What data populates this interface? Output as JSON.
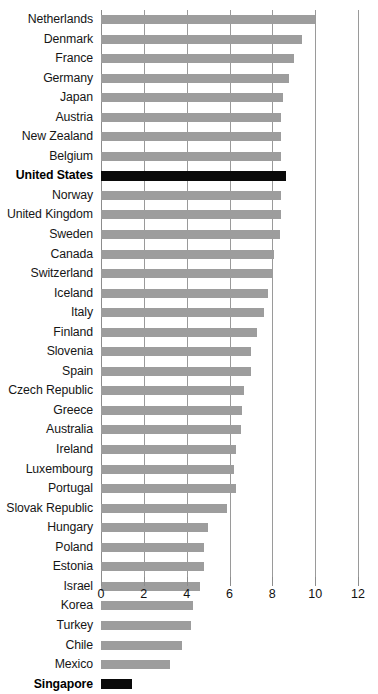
{
  "chart_data": {
    "type": "bar",
    "orientation": "horizontal",
    "title": "",
    "xlabel": "",
    "ylabel": "",
    "xlim": [
      0,
      12
    ],
    "xticks": [
      0,
      2,
      4,
      6,
      8,
      10,
      12
    ],
    "xtick_labels": [
      "0",
      "2",
      "4",
      "6",
      "8",
      "10",
      "12"
    ],
    "grid": true,
    "legend": false,
    "sorted": "descending",
    "colors": {
      "bar": "#9d9d9d",
      "bar_highlight": "#0a0a0a",
      "gridline": "#9a9a9a",
      "text": "#111111",
      "background": "#ffffff"
    },
    "highlighted_categories": [
      "United States",
      "Singapore"
    ],
    "categories": [
      "Netherlands",
      "Denmark",
      "France",
      "Germany",
      "Japan",
      "Austria",
      "New Zealand",
      "Belgium",
      "United States",
      "Norway",
      "United Kingdom",
      "Sweden",
      "Canada",
      "Switzerland",
      "Iceland",
      "Italy",
      "Finland",
      "Slovenia",
      "Spain",
      "Czech Republic",
      "Greece",
      "Australia",
      "Ireland",
      "Luxembourg",
      "Portugal",
      "Slovak Republic",
      "Hungary",
      "Poland",
      "Estonia",
      "Israel",
      "Korea",
      "Turkey",
      "Chile",
      "Mexico",
      "Singapore"
    ],
    "values": [
      10.0,
      9.4,
      9.0,
      8.8,
      8.5,
      8.4,
      8.4,
      8.4,
      8.65,
      8.4,
      8.4,
      8.35,
      8.1,
      8.0,
      7.8,
      7.6,
      7.3,
      7.0,
      7.0,
      6.7,
      6.6,
      6.55,
      6.3,
      6.2,
      6.3,
      5.9,
      5.0,
      4.8,
      4.8,
      4.6,
      4.3,
      4.2,
      3.8,
      3.2,
      1.45
    ]
  },
  "title_ghost": ""
}
